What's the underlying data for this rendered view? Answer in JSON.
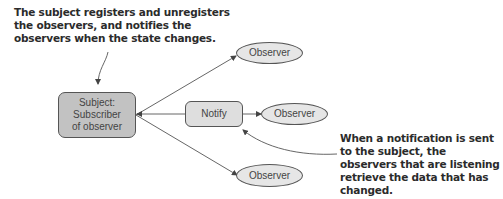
{
  "annotations": {
    "top": "The subject registers and unregisters the observers, and notifies the observers when the state changes.",
    "bottom": "When a notification is sent to the subject, the observers that are listening retrieve the data that has changed."
  },
  "nodes": {
    "subject": {
      "line1": "Subject:",
      "line2": "Subscriber",
      "line3": "of observer"
    },
    "notify": "Notify",
    "observers": [
      "Observer",
      "Observer",
      "Observer"
    ]
  },
  "colors": {
    "subject_fill": "#c2c2c2",
    "notify_fill": "#dedede",
    "observer_fill": "#e6e6e6",
    "stroke": "#555555",
    "annotation_text": "#2b2b2b"
  }
}
